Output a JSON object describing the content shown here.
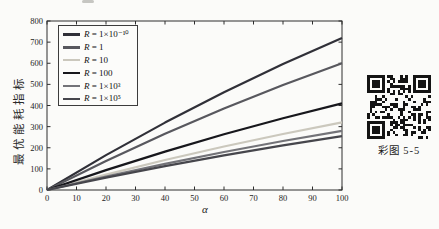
{
  "chart_data": {
    "type": "line",
    "title": "",
    "xlabel": "α",
    "ylabel": "最优能耗指标",
    "xlim": [
      0,
      100
    ],
    "ylim": [
      0,
      800
    ],
    "xticks": [
      0,
      10,
      20,
      30,
      40,
      50,
      60,
      70,
      80,
      90,
      100
    ],
    "yticks": [
      0,
      100,
      200,
      300,
      400,
      500,
      600,
      700,
      800
    ],
    "grid": false,
    "legend_position": "top-left",
    "x": [
      0,
      20,
      40,
      60,
      80,
      100
    ],
    "series": [
      {
        "name": "R = 1×10⁻¹⁰",
        "color": "#303038",
        "values": [
          0,
          165,
          319,
          463,
          597,
          720
        ]
      },
      {
        "name": "R = 1",
        "color": "#58585e",
        "values": [
          0,
          137,
          266,
          386,
          497,
          600
        ]
      },
      {
        "name": "R = 10",
        "color": "#cbc8bd",
        "values": [
          0,
          73,
          142,
          206,
          265,
          320
        ]
      },
      {
        "name": "R = 100",
        "color": "#17171c",
        "values": [
          0,
          94,
          182,
          264,
          340,
          410
        ]
      },
      {
        "name": "R = 1×10³",
        "color": "#737378",
        "values": [
          0,
          64,
          124,
          180,
          232,
          280
        ]
      },
      {
        "name": "R = 1×10⁵",
        "color": "#46464c",
        "values": [
          0,
          58,
          113,
          164,
          211,
          255
        ]
      }
    ],
    "axis_color": "#2e2e2e"
  },
  "qr": {
    "caption": "彩图 5-5"
  }
}
